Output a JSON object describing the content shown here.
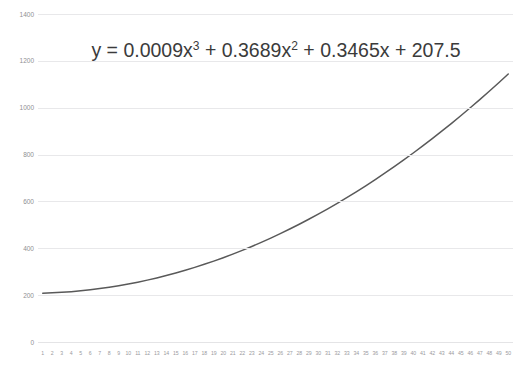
{
  "chart_data": {
    "type": "line",
    "title": "",
    "xlabel": "",
    "ylabel": "",
    "xlim": [
      1,
      50
    ],
    "ylim": [
      0,
      1400
    ],
    "grid": true,
    "legend": false,
    "annotation": "y = 0.0009x³ + 0.3689x² + 0.3465x + 207.5",
    "equation": {
      "lhs": "y",
      "equals": "=",
      "term1_coef": "0.0009x",
      "term1_exp": "3",
      "plus1": "+",
      "term2_coef": "0.3689x",
      "term2_exp": "2",
      "plus2": "+",
      "term3": "0.3465x",
      "plus3": "+",
      "constant": "207.5"
    },
    "y_ticks": [
      "0",
      "200",
      "400",
      "600",
      "800",
      "1000",
      "1200",
      "1400"
    ],
    "y_tick_values": [
      0,
      200,
      400,
      600,
      800,
      1000,
      1200,
      1400
    ],
    "x_ticks": [
      "1",
      "2",
      "3",
      "4",
      "5",
      "6",
      "7",
      "8",
      "9",
      "10",
      "11",
      "12",
      "13",
      "14",
      "15",
      "16",
      "17",
      "18",
      "19",
      "20",
      "21",
      "22",
      "23",
      "24",
      "25",
      "26",
      "27",
      "28",
      "29",
      "30",
      "31",
      "32",
      "33",
      "34",
      "35",
      "36",
      "37",
      "38",
      "39",
      "40",
      "41",
      "42",
      "43",
      "44",
      "45",
      "46",
      "47",
      "48",
      "49",
      "50"
    ],
    "series": [
      {
        "name": "trendline",
        "color": "#595959",
        "x": [
          1,
          2,
          3,
          4,
          5,
          6,
          7,
          8,
          9,
          10,
          11,
          12,
          13,
          14,
          15,
          16,
          17,
          18,
          19,
          20,
          21,
          22,
          23,
          24,
          25,
          26,
          27,
          28,
          29,
          30,
          31,
          32,
          33,
          34,
          35,
          36,
          37,
          38,
          39,
          40,
          41,
          42,
          43,
          44,
          45,
          46,
          47,
          48,
          49,
          50
        ],
        "values": [
          208.2,
          209.7,
          211.9,
          214.8,
          218.5,
          222.8,
          227.9,
          233.7,
          240.2,
          247.4,
          255.4,
          264.1,
          273.5,
          283.6,
          294.5,
          306.1,
          318.4,
          331.5,
          345.3,
          359.8,
          375.1,
          391.1,
          407.8,
          425.3,
          443.5,
          462.5,
          482.2,
          502.6,
          523.8,
          545.8,
          568.5,
          591.9,
          616.1,
          641.1,
          666.8,
          693.2,
          720.5,
          748.4,
          777.2,
          806.7,
          837.0,
          868.0,
          899.8,
          932.4,
          965.7,
          999.8,
          1034.7,
          1070.4,
          1106.8,
          1144.0
        ]
      }
    ]
  },
  "axis": {
    "y_label_0": "0",
    "y_label_200": "200",
    "y_label_400": "400",
    "y_label_600": "600",
    "y_label_800": "800",
    "y_label_1000": "1000",
    "y_label_1200": "1200",
    "y_label_1400": "1400"
  }
}
